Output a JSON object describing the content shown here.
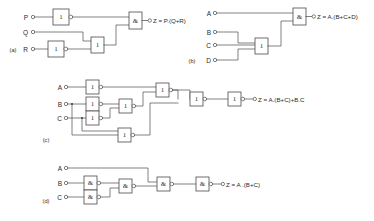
{
  "figure": {
    "background_color": "#ffffff",
    "line_color": "#4a4a4a"
  },
  "panels": [
    {
      "id": "a",
      "label": "(a)",
      "inputs": [
        "P",
        "Q",
        "R"
      ],
      "output_label": "Z = P.(Q+R)",
      "gates": [
        {
          "name": "inverter-p",
          "symbol": "1",
          "type": "NOT"
        },
        {
          "name": "inverter-r",
          "symbol": "1",
          "type": "NOT"
        },
        {
          "name": "or-gate",
          "symbol": "1",
          "type": "OR"
        },
        {
          "name": "and-gate",
          "symbol": "&",
          "type": "AND"
        }
      ]
    },
    {
      "id": "b",
      "label": "(b)",
      "inputs": [
        "A",
        "B",
        "C",
        "D"
      ],
      "output_label": "Z = A.(B+C+D)",
      "gates": [
        {
          "name": "or-gate",
          "symbol": "1",
          "type": "OR"
        },
        {
          "name": "and-gate",
          "symbol": "&",
          "type": "AND"
        }
      ]
    },
    {
      "id": "c",
      "label": "(c)",
      "inputs": [
        "A",
        "B",
        "C"
      ],
      "output_label": "Z = A.(B+C)+B.C",
      "gates": [
        {
          "name": "nor-gate-1",
          "symbol": "1",
          "type": "NOR"
        },
        {
          "name": "nor-gate-2",
          "symbol": "1",
          "type": "NOR"
        },
        {
          "name": "nor-gate-3",
          "symbol": "1",
          "type": "NOR"
        },
        {
          "name": "nor-gate-4",
          "symbol": "1",
          "type": "NOR"
        },
        {
          "name": "nor-gate-5",
          "symbol": "1",
          "type": "NOR"
        },
        {
          "name": "nor-gate-6",
          "symbol": "1",
          "type": "NOR"
        },
        {
          "name": "nor-gate-7",
          "symbol": "1",
          "type": "NOR"
        },
        {
          "name": "nor-gate-8",
          "symbol": "1",
          "type": "NOR"
        }
      ]
    },
    {
      "id": "d",
      "label": "(d)",
      "inputs": [
        "A",
        "B",
        "C"
      ],
      "output_label": "Z = A .(B+C)",
      "gates": [
        {
          "name": "nand-gate-1",
          "symbol": "&",
          "type": "NAND"
        },
        {
          "name": "nand-gate-2",
          "symbol": "&",
          "type": "NAND"
        },
        {
          "name": "nand-gate-3",
          "symbol": "&",
          "type": "NAND"
        },
        {
          "name": "nand-gate-4",
          "symbol": "&",
          "type": "NAND"
        },
        {
          "name": "nand-gate-5",
          "symbol": "&",
          "type": "NAND"
        }
      ]
    }
  ]
}
